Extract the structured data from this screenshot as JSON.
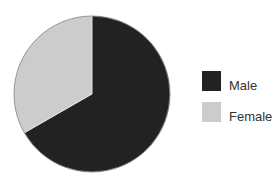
{
  "chart_data": {
    "type": "pie",
    "title": "",
    "categories": [
      "Male",
      "Female"
    ],
    "values": [
      66.7,
      33.3
    ],
    "unit": "%",
    "colors": [
      "#222222",
      "#cccccc"
    ],
    "start_angle_deg": 0,
    "direction": "clockwise",
    "legend_position": "right",
    "data_labels": false
  },
  "legend": {
    "items": [
      {
        "label": "Male",
        "color": "#222222"
      },
      {
        "label": "Female",
        "color": "#cccccc"
      }
    ]
  }
}
